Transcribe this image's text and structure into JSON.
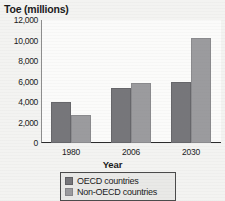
{
  "chart_data": {
    "type": "bar",
    "title": "",
    "xlabel": "Year",
    "ylabel": "Toe (millions)",
    "categories": [
      "1980",
      "2006",
      "2030"
    ],
    "series": [
      {
        "name": "OECD countries",
        "values": [
          4000,
          5400,
          6000
        ],
        "color": "#76767a"
      },
      {
        "name": "Non-OECD countries",
        "values": [
          2700,
          5900,
          10200
        ],
        "color": "#9b9b9e"
      }
    ],
    "ylim": [
      0,
      12000
    ],
    "ytick_step": 2000,
    "ytick_labels": [
      "12,000",
      "10,000",
      "8,000",
      "6,000",
      "4,000",
      "2,000",
      "0"
    ],
    "ytick_values": [
      12000,
      10000,
      8000,
      6000,
      4000,
      2000,
      0
    ],
    "grid": false,
    "legend_position": "bottom",
    "legend_boxed": true
  },
  "axes": {
    "y_title": "Toe (millions)",
    "x_title": "Year"
  },
  "legend": {
    "entries": [
      {
        "label": "OECD countries",
        "swatch": "oecd-swatch"
      },
      {
        "label": "Non-OECD countries",
        "swatch": "non-oecd-swatch"
      }
    ]
  }
}
